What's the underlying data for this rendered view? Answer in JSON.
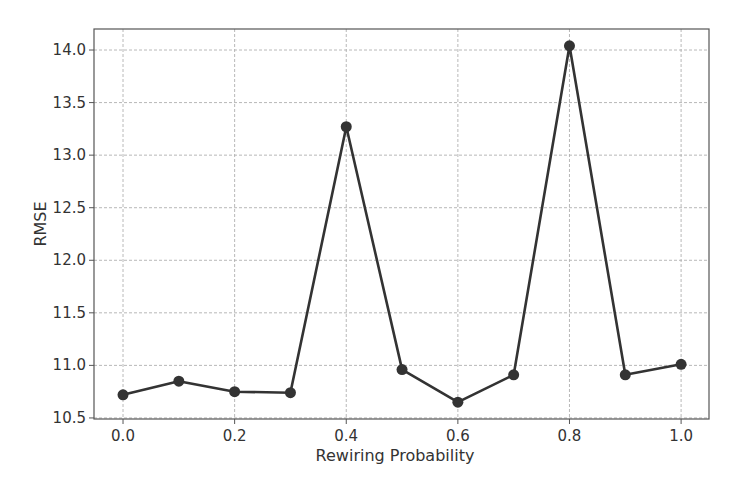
{
  "chart_data": {
    "type": "line",
    "title": "",
    "xlabel": "Rewiring Probability",
    "ylabel": "RMSE",
    "x": [
      0.0,
      0.1,
      0.2,
      0.3,
      0.4,
      0.5,
      0.6,
      0.7,
      0.8,
      0.9,
      1.0
    ],
    "series": [
      {
        "name": "RMSE",
        "values": [
          10.72,
          10.85,
          10.75,
          10.74,
          13.27,
          10.96,
          10.65,
          10.91,
          14.04,
          10.91,
          11.01
        ],
        "color": "#333333",
        "marker": "circle"
      }
    ],
    "xticks": [
      0.0,
      0.2,
      0.4,
      0.6,
      0.8,
      1.0
    ],
    "xtick_labels": [
      "0.0",
      "0.2",
      "0.4",
      "0.6",
      "0.8",
      "1.0"
    ],
    "yticks": [
      10.5,
      11.0,
      11.5,
      12.0,
      12.5,
      13.0,
      13.5,
      14.0
    ],
    "ytick_labels": [
      "10.5",
      "11.0",
      "11.5",
      "12.0",
      "12.5",
      "13.0",
      "13.5",
      "14.0"
    ],
    "xlim": [
      -0.052,
      1.05
    ],
    "ylim": [
      10.49,
      14.2
    ],
    "grid": true,
    "legend": null
  }
}
